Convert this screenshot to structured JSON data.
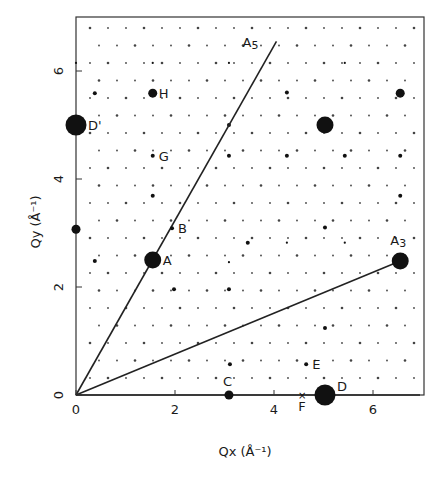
{
  "figure": {
    "xlabel": "Qx (Å⁻¹)",
    "ylabel": "Qy (Å⁻¹)",
    "xticks": [
      "0",
      "2",
      "4",
      "6"
    ],
    "yticks": [
      "0",
      "2",
      "4",
      "6"
    ],
    "xrange": [
      0,
      7
    ],
    "yrange": [
      0,
      7
    ],
    "line_color": "#222222",
    "dot_color": "#111111"
  },
  "lines": [
    {
      "name": "A5",
      "label": "A5",
      "from": [
        0,
        0
      ],
      "to": [
        4.05,
        6.55
      ]
    },
    {
      "name": "A3",
      "label": "A3",
      "from": [
        0,
        0
      ],
      "to": [
        6.55,
        2.48
      ]
    },
    {
      "name": "x-axis-segment",
      "from": [
        0,
        0
      ],
      "to": [
        6.95,
        0
      ]
    }
  ],
  "labeled_points": [
    {
      "label": "A",
      "x": 1.55,
      "y": 2.5,
      "size": "large"
    },
    {
      "label": "B",
      "x": 1.94,
      "y": 3.09,
      "size": "small"
    },
    {
      "label": "C",
      "x": 3.09,
      "y": 0.0,
      "size": "medium"
    },
    {
      "label": "D",
      "x": 5.03,
      "y": 0.0,
      "size": "xlarge"
    },
    {
      "label": "D'",
      "x": 0.0,
      "y": 5.0,
      "size": "xlarge"
    },
    {
      "label": "E",
      "x": 4.65,
      "y": 0.57,
      "size": "small"
    },
    {
      "label": "F",
      "x": 4.57,
      "y": 0.0,
      "size": "cross"
    },
    {
      "label": "G",
      "x": 1.55,
      "y": 4.43,
      "size": "small"
    },
    {
      "label": "H",
      "x": 1.55,
      "y": 5.59,
      "size": "medium"
    },
    {
      "label": "A3",
      "x": 6.55,
      "y": 2.48,
      "size": "large"
    }
  ],
  "unlabeled_points": [
    {
      "x": 5.03,
      "y": 5.0,
      "size": "large"
    },
    {
      "x": 6.55,
      "y": 5.59,
      "size": "medium"
    },
    {
      "x": 0.0,
      "y": 3.07,
      "size": "medium"
    },
    {
      "x": 0.0,
      "y": 6.15,
      "size": "tiny"
    },
    {
      "x": 0.38,
      "y": 5.59,
      "size": "small"
    },
    {
      "x": 0.38,
      "y": 2.48,
      "size": "small"
    },
    {
      "x": 3.09,
      "y": 4.43,
      "size": "small"
    },
    {
      "x": 3.09,
      "y": 1.96,
      "size": "small"
    },
    {
      "x": 3.11,
      "y": 0.57,
      "size": "small"
    },
    {
      "x": 1.55,
      "y": 3.69,
      "size": "small"
    },
    {
      "x": 3.09,
      "y": 2.46,
      "size": "tiny"
    },
    {
      "x": 1.98,
      "y": 1.96,
      "size": "small"
    },
    {
      "x": 4.26,
      "y": 4.43,
      "size": "small"
    },
    {
      "x": 5.43,
      "y": 4.43,
      "size": "small"
    },
    {
      "x": 6.55,
      "y": 4.43,
      "size": "small"
    },
    {
      "x": 5.03,
      "y": 3.1,
      "size": "small"
    },
    {
      "x": 6.55,
      "y": 3.69,
      "size": "small"
    },
    {
      "x": 5.43,
      "y": 2.82,
      "size": "tiny"
    },
    {
      "x": 4.26,
      "y": 2.82,
      "size": "tiny"
    },
    {
      "x": 3.47,
      "y": 2.82,
      "size": "small"
    },
    {
      "x": 5.03,
      "y": 1.24,
      "size": "small"
    },
    {
      "x": 3.09,
      "y": 5.0,
      "size": "small"
    },
    {
      "x": 3.09,
      "y": 6.15,
      "size": "tiny"
    },
    {
      "x": 5.43,
      "y": 6.15,
      "size": "tiny"
    },
    {
      "x": 4.26,
      "y": 5.6,
      "size": "small"
    },
    {
      "x": 1.55,
      "y": 6.15,
      "size": "tiny"
    }
  ]
}
